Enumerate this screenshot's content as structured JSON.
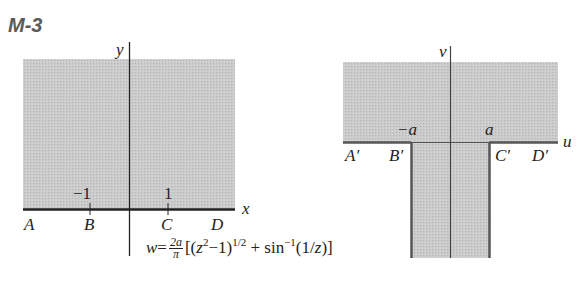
{
  "figure_label": "M-3",
  "colors": {
    "shade": "#c8c8c8",
    "axis": "#222222",
    "boundary": "#555555"
  },
  "z_plane": {
    "x_axis_label": "x",
    "y_axis_label": "y",
    "ticks": [
      {
        "value": "−1",
        "point": "B"
      },
      {
        "value": "1",
        "point": "C"
      }
    ],
    "points": [
      "A",
      "B",
      "C",
      "D"
    ],
    "region": "upper half-plane (shaded)"
  },
  "w_plane": {
    "u_axis_label": "u",
    "v_axis_label": "v",
    "ticks": [
      {
        "value": "−a",
        "point": "B′"
      },
      {
        "value": "a",
        "point": "C′"
      }
    ],
    "points": [
      "A′",
      "B′",
      "C′",
      "D′"
    ],
    "region": "upper half-plane plus semi-infinite strip −a < u < a, v < 0 (shaded)"
  },
  "formula": {
    "lhs": "w",
    "eq": "=",
    "frac_num": "2a",
    "frac_den": "π",
    "open": "[(",
    "z": "z",
    "z_exp": "2",
    "minus_one": "−1)",
    "half_exp": "1/2",
    "plus_sin": " + sin",
    "inv_exp": "−1",
    "arg_open": "(1/",
    "arg_z": "z",
    "close": ")]"
  }
}
